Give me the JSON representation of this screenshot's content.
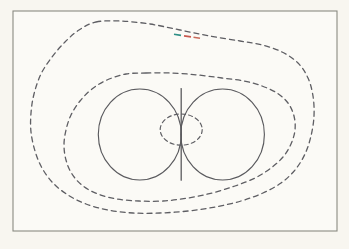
{
  "figure": {
    "kind": "contour-diagram",
    "background_color": "#f8f6f0",
    "frame": {
      "name": "figure-frame",
      "x": 13,
      "y": 11,
      "width": 324,
      "height": 220,
      "stroke": "#8a8a82",
      "stroke_width": 1.1,
      "fill": "#fbfaf6"
    },
    "curves": [
      {
        "id": "outer-contour",
        "label": "outermost dashed contour",
        "style": "dashed",
        "stroke": "#5e5e63",
        "stroke_width": 1.3,
        "dash_pattern": "5 4",
        "closed": true,
        "points": [
          [
            96,
            22
          ],
          [
            120,
            21
          ],
          [
            150,
            24
          ],
          [
            180,
            30
          ],
          [
            210,
            36
          ],
          [
            240,
            41
          ],
          [
            262,
            45
          ],
          [
            282,
            52
          ],
          [
            298,
            63
          ],
          [
            308,
            78
          ],
          [
            313,
            96
          ],
          [
            314,
            116
          ],
          [
            311,
            136
          ],
          [
            305,
            154
          ],
          [
            295,
            170
          ],
          [
            281,
            183
          ],
          [
            263,
            193
          ],
          [
            241,
            201
          ],
          [
            215,
            207
          ],
          [
            188,
            211
          ],
          [
            160,
            213
          ],
          [
            133,
            213
          ],
          [
            108,
            210
          ],
          [
            86,
            204
          ],
          [
            68,
            195
          ],
          [
            53,
            183
          ],
          [
            42,
            168
          ],
          [
            35,
            151
          ],
          [
            31,
            132
          ],
          [
            31,
            113
          ],
          [
            34,
            94
          ],
          [
            41,
            74
          ],
          [
            52,
            57
          ],
          [
            65,
            42
          ],
          [
            79,
            30
          ],
          [
            96,
            22
          ]
        ]
      },
      {
        "id": "middle-contour",
        "label": "middle dashed contour",
        "style": "dashed",
        "stroke": "#5e5e63",
        "stroke_width": 1.3,
        "dash_pattern": "5 4",
        "closed": true,
        "points": [
          [
            146,
            73
          ],
          [
            172,
            73
          ],
          [
            198,
            75
          ],
          [
            222,
            78
          ],
          [
            244,
            81
          ],
          [
            262,
            86
          ],
          [
            277,
            93
          ],
          [
            288,
            103
          ],
          [
            294,
            116
          ],
          [
            295,
            130
          ],
          [
            291,
            144
          ],
          [
            283,
            157
          ],
          [
            271,
            168
          ],
          [
            255,
            178
          ],
          [
            235,
            186
          ],
          [
            212,
            193
          ],
          [
            188,
            198
          ],
          [
            163,
            201
          ],
          [
            139,
            201
          ],
          [
            117,
            199
          ],
          [
            98,
            194
          ],
          [
            83,
            186
          ],
          [
            72,
            174
          ],
          [
            66,
            160
          ],
          [
            64,
            145
          ],
          [
            66,
            130
          ],
          [
            71,
            115
          ],
          [
            80,
            101
          ],
          [
            92,
            89
          ],
          [
            107,
            80
          ],
          [
            126,
            74
          ],
          [
            146,
            73
          ]
        ]
      },
      {
        "id": "left-circle",
        "label": "left solid circle",
        "style": "solid",
        "stroke": "#5a5a5e",
        "stroke_width": 1.15,
        "shape": "ellipse",
        "cx": 139.8,
        "cy": 134.5,
        "rx": 41.5,
        "ry": 45.5
      },
      {
        "id": "right-circle",
        "label": "right solid circle",
        "style": "solid",
        "stroke": "#5a5a5e",
        "stroke_width": 1.15,
        "shape": "ellipse",
        "cx": 222.6,
        "cy": 134.5,
        "rx": 41.8,
        "ry": 45.5
      },
      {
        "id": "separating-line",
        "label": "vertical solid separating line at tangency",
        "style": "solid",
        "stroke": "#5a5a5e",
        "stroke_width": 1.3,
        "shape": "line",
        "x1": 181.2,
        "y1": 88.6,
        "x2": 181.2,
        "y2": 180.2
      },
      {
        "id": "inner-ellipse",
        "label": "small dashed ellipse at tangency point",
        "style": "dashed",
        "stroke": "#5e5e63",
        "stroke_width": 1.15,
        "dash_pattern": "4 3.2",
        "shape": "ellipse",
        "cx": 181.2,
        "cy": 129.6,
        "rx": 21.0,
        "ry": 15.6
      }
    ],
    "color_accents": [
      {
        "id": "teal-dash",
        "label": "teal colored dash segment on outer contour",
        "color": "#2e8f86",
        "x1": 174,
        "y1": 34.2,
        "x2": 181,
        "y2": 35.4,
        "stroke_width": 1.6
      },
      {
        "id": "red-dash-1",
        "label": "red colored dash segment on outer contour",
        "color": "#c8584e",
        "x1": 184,
        "y1": 35.9,
        "x2": 191,
        "y2": 36.9,
        "stroke_width": 1.6
      },
      {
        "id": "red-dash-2",
        "label": "second red colored dash segment on outer contour",
        "color": "#c96a5a",
        "x1": 193.5,
        "y1": 37.2,
        "x2": 200,
        "y2": 38.2,
        "stroke_width": 1.6
      }
    ]
  },
  "chart_data": {
    "type": "line",
    "title": "",
    "subtitle": "",
    "xlabel": "",
    "ylabel": "",
    "grid": false,
    "legend_position": "none",
    "series": [
      {
        "name": "outer-contour",
        "style": "dashed",
        "closed": true
      },
      {
        "name": "middle-contour",
        "style": "dashed",
        "closed": true
      },
      {
        "name": "left-circle",
        "style": "solid",
        "closed": true
      },
      {
        "name": "right-circle",
        "style": "solid",
        "closed": true
      },
      {
        "name": "inner-ellipse",
        "style": "dashed",
        "closed": true
      },
      {
        "name": "separating-line",
        "style": "solid",
        "closed": false
      }
    ],
    "annotations": []
  }
}
